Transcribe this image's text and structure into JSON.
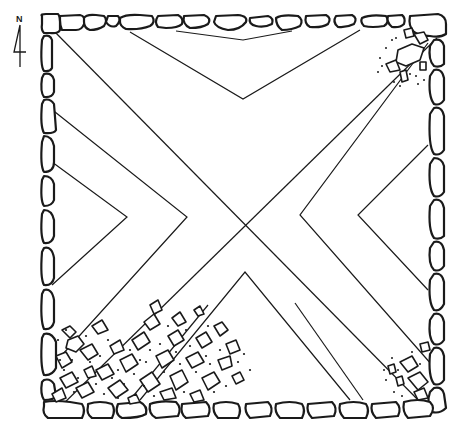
{
  "figure": {
    "type": "archaeological-plan",
    "north_arrow": {
      "label": "N",
      "position": [
        20,
        50
      ]
    },
    "colors": {
      "ink": "#1a1a1a",
      "paper": "#ffffff"
    },
    "enclosure": {
      "outer_bounds": [
        38,
        14,
        448,
        418
      ],
      "center": [
        244,
        215
      ]
    },
    "pattern": {
      "description": "two crossing diagonals forming an X with nested chevrons in each quadrant",
      "chevron_apexes": {
        "top": [
          [
            243,
            40
          ],
          [
            243,
            99
          ]
        ],
        "left": [
          [
            127,
            217
          ],
          [
            187,
            217
          ]
        ],
        "right": [
          [
            300,
            215
          ],
          [
            358,
            215
          ]
        ],
        "bottom": [
          [
            245,
            272
          ]
        ]
      }
    },
    "rubble_areas": [
      "top-right corner",
      "bottom-left corner (extensive)",
      "bottom-right corner"
    ]
  }
}
